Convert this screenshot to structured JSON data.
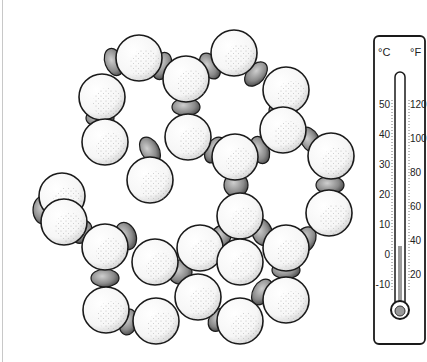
{
  "figure": {
    "lattice": {
      "oxygen_radius": 23,
      "oxygens": [
        [
          139,
          58
        ],
        [
          234,
          53
        ],
        [
          186,
          79
        ],
        [
          102,
          97
        ],
        [
          286,
          90
        ],
        [
          105,
          142
        ],
        [
          188,
          137
        ],
        [
          283,
          130
        ],
        [
          331,
          156
        ],
        [
          235,
          157
        ],
        [
          150,
          180
        ],
        [
          62,
          196
        ],
        [
          64,
          222
        ],
        [
          240,
          216
        ],
        [
          329,
          213
        ],
        [
          105,
          247
        ],
        [
          200,
          248
        ],
        [
          286,
          248
        ],
        [
          155,
          262
        ],
        [
          240,
          262
        ],
        [
          106,
          310
        ],
        [
          156,
          321
        ],
        [
          198,
          297
        ],
        [
          240,
          321
        ],
        [
          286,
          300
        ]
      ],
      "hydrogens": [
        [
          114,
          62,
          9,
          14,
          -20
        ],
        [
          162,
          66,
          9,
          14,
          20
        ],
        [
          210,
          66,
          9,
          14,
          -30
        ],
        [
          256,
          74,
          9,
          14,
          40
        ],
        [
          100,
          118,
          14,
          9,
          0
        ],
        [
          186,
          107,
          14,
          9,
          0
        ],
        [
          283,
          110,
          14,
          9,
          0
        ],
        [
          310,
          140,
          9,
          14,
          -30
        ],
        [
          150,
          150,
          9,
          14,
          -30
        ],
        [
          215,
          150,
          9,
          14,
          30
        ],
        [
          260,
          150,
          9,
          14,
          -20
        ],
        [
          67,
          215,
          14,
          9,
          0
        ],
        [
          236,
          185,
          12,
          12,
          0
        ],
        [
          152,
          186,
          14,
          9,
          0
        ],
        [
          330,
          185,
          14,
          9,
          0
        ],
        [
          43,
          210,
          10,
          14,
          0
        ],
        [
          82,
          232,
          9,
          12,
          30
        ],
        [
          126,
          236,
          10,
          14,
          -20
        ],
        [
          220,
          238,
          10,
          14,
          30
        ],
        [
          262,
          232,
          10,
          14,
          -20
        ],
        [
          305,
          240,
          10,
          14,
          30
        ],
        [
          105,
          278,
          14,
          9,
          0
        ],
        [
          180,
          272,
          12,
          12,
          0
        ],
        [
          286,
          270,
          14,
          9,
          0
        ],
        [
          128,
          322,
          9,
          13,
          10
        ],
        [
          218,
          320,
          9,
          12,
          30
        ],
        [
          262,
          292,
          9,
          14,
          30
        ]
      ]
    },
    "thermometer": {
      "celsius_label": "°C",
      "fahrenheit_label": "°F",
      "celsius_ticks": [
        "50",
        "40",
        "30",
        "20",
        "10",
        "0",
        "-10"
      ],
      "fahrenheit_ticks": [
        "120",
        "100",
        "80",
        "60",
        "40",
        "20"
      ],
      "mercury_level_celsius": "0"
    }
  }
}
